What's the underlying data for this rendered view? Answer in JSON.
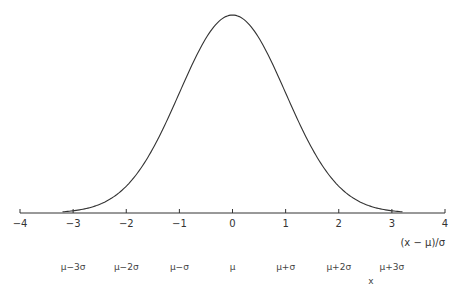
{
  "chart_data": {
    "type": "line",
    "title": "",
    "xlabel": "(x − μ)/σ",
    "secondary_xlabel": "x",
    "ylabel": "",
    "xlim": [
      -4,
      4
    ],
    "xticks": [
      -4,
      -3,
      -2,
      -1,
      0,
      1,
      2,
      3,
      4
    ],
    "xtick_labels": [
      "−4",
      "−3",
      "−2",
      "−1",
      "0",
      "1",
      "2",
      "3",
      "4"
    ],
    "secondary_ticks": [
      {
        "x": -3,
        "label": "μ−3σ"
      },
      {
        "x": -2,
        "label": "μ−2σ"
      },
      {
        "x": -1,
        "label": "μ−σ"
      },
      {
        "x": 0,
        "label": "μ"
      },
      {
        "x": 1,
        "label": "μ+σ"
      },
      {
        "x": 2,
        "label": "μ+2σ"
      },
      {
        "x": 3,
        "label": "μ+3σ"
      }
    ],
    "series": [
      {
        "name": "normal density",
        "x_range": [
          -3.2,
          3.2
        ],
        "peak": 0.3989
      }
    ],
    "grid": false,
    "legend": null
  },
  "labels": {
    "xlabel": "(x − μ)/σ",
    "x": "x"
  }
}
